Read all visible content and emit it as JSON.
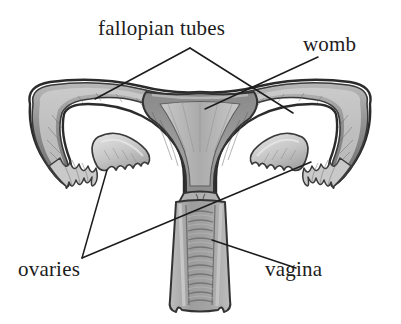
{
  "figure": {
    "background_color": "#ffffff",
    "line_color": "#1c1c1c",
    "labels": [
      {
        "id": "fallopian-tubes",
        "text": "fallopian tubes"
      },
      {
        "id": "womb",
        "text": "womb"
      },
      {
        "id": "ovaries",
        "text": "ovaries"
      },
      {
        "id": "vagina",
        "text": "vagina"
      }
    ]
  },
  "palette": {
    "outline": "#2a2a2a",
    "wall_dark": "#6f6f6f",
    "wall_mid": "#8e8e8e",
    "wall_light": "#c4c4c4",
    "cavity": "#9a9a9a",
    "ovary": "#cfcfcf",
    "highlight": "#e2e2e2",
    "vagina_fill": "#a8a8a8"
  },
  "structures": [
    {
      "id": "left-fallopian-tube",
      "name": "fallopian tube (left)"
    },
    {
      "id": "right-fallopian-tube",
      "name": "fallopian tube (right)"
    },
    {
      "id": "left-fimbriae",
      "name": "fimbriae (left)"
    },
    {
      "id": "right-fimbriae",
      "name": "fimbriae (right)"
    },
    {
      "id": "left-ovary",
      "name": "ovary (left)"
    },
    {
      "id": "right-ovary",
      "name": "ovary (right)"
    },
    {
      "id": "uterus-body",
      "name": "womb / uterus"
    },
    {
      "id": "uterine-cavity",
      "name": "uterine cavity"
    },
    {
      "id": "cervix",
      "name": "cervix"
    },
    {
      "id": "vagina-canal",
      "name": "vagina"
    }
  ],
  "leader_lines": [
    {
      "id": "leader-fallopian-left",
      "from": "fallopian tubes",
      "to": "left fallopian tube"
    },
    {
      "id": "leader-fallopian-right",
      "from": "fallopian tubes",
      "to": "right fallopian tube"
    },
    {
      "id": "leader-womb",
      "from": "womb",
      "to": "uterus body"
    },
    {
      "id": "leader-ovary-left",
      "from": "ovaries",
      "to": "left ovary"
    },
    {
      "id": "leader-ovary-right",
      "from": "ovaries",
      "to": "right ovary"
    },
    {
      "id": "leader-vagina",
      "from": "vagina",
      "to": "vaginal canal"
    }
  ]
}
